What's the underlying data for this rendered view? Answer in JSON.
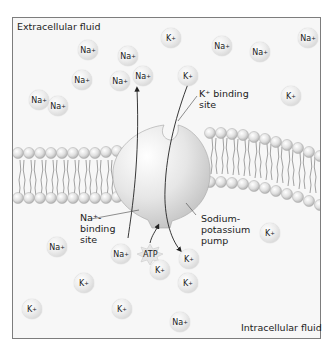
{
  "regions": {
    "extracellular": "Extracellular fluid",
    "intracellular": "Intracellular fluid"
  },
  "labels": {
    "k_binding_site": "K⁺ binding\nsite",
    "na_binding_site": "Na⁺-\nbinding\nsite",
    "pump": "Sodium-\npotassium\npump",
    "atp": "ATP"
  },
  "ions": [
    {
      "type": "Na",
      "side": "extracellular",
      "x": 39,
      "y": 100
    },
    {
      "type": "Na",
      "side": "extracellular",
      "x": 88,
      "y": 50
    },
    {
      "type": "Na",
      "side": "extracellular",
      "x": 82,
      "y": 80
    },
    {
      "type": "Na",
      "side": "extracellular",
      "x": 128,
      "y": 56
    },
    {
      "type": "Na",
      "side": "extracellular",
      "x": 120,
      "y": 81
    },
    {
      "type": "Na",
      "side": "extracellular",
      "x": 143,
      "y": 76
    },
    {
      "type": "Na",
      "side": "extracellular",
      "x": 58,
      "y": 106
    },
    {
      "type": "K",
      "side": "extracellular",
      "x": 171,
      "y": 38
    },
    {
      "type": "Na",
      "side": "extracellular",
      "x": 222,
      "y": 46
    },
    {
      "type": "Na",
      "side": "extracellular",
      "x": 260,
      "y": 52
    },
    {
      "type": "Na",
      "side": "extracellular",
      "x": 308,
      "y": 38
    },
    {
      "type": "K",
      "side": "extracellular",
      "x": 188,
      "y": 76
    },
    {
      "type": "K",
      "side": "extracellular",
      "x": 291,
      "y": 96
    },
    {
      "type": "Na",
      "side": "intracellular",
      "x": 57,
      "y": 247
    },
    {
      "type": "Na",
      "side": "intracellular",
      "x": 121,
      "y": 254
    },
    {
      "type": "K",
      "side": "intracellular",
      "x": 84,
      "y": 283
    },
    {
      "type": "K",
      "side": "intracellular",
      "x": 32,
      "y": 309
    },
    {
      "type": "K",
      "side": "intracellular",
      "x": 122,
      "y": 309
    },
    {
      "type": "K",
      "side": "intracellular",
      "x": 189,
      "y": 259
    },
    {
      "type": "K",
      "side": "intracellular",
      "x": 188,
      "y": 283
    },
    {
      "type": "K",
      "side": "intracellular",
      "x": 270,
      "y": 233
    },
    {
      "type": "Na",
      "side": "intracellular",
      "x": 180,
      "y": 322
    },
    {
      "type": "K",
      "side": "intracellular",
      "x": 160,
      "y": 270
    }
  ],
  "ion_labels": {
    "Na": "Na",
    "K": "K",
    "charge": "+"
  },
  "colors": {
    "frame_border": "#7d7d7d",
    "background": "#f7f7f7",
    "membrane_head": "#d8d8d8",
    "pump": "#e4e4e4",
    "text": "#222222"
  }
}
